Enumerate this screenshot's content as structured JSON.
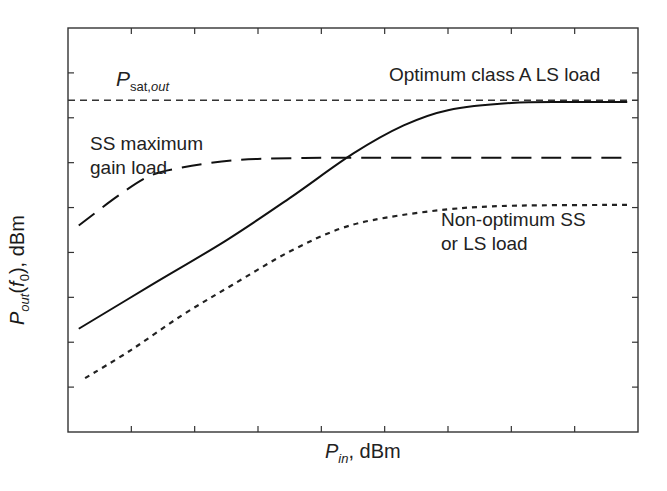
{
  "chart_data": {
    "type": "line",
    "title": "",
    "xlabel": "P_in, dBm",
    "ylabel": "P_out(f_0), dBm",
    "xlabel_parts": {
      "main": "P",
      "sub": "in",
      "unit": ", dBm"
    },
    "ylabel_parts": {
      "main": "P",
      "sub": "out",
      "arg_pre": "(",
      "arg": "f",
      "arg_sub": "0",
      "arg_post": ")",
      "unit": ", dBm"
    },
    "x_ticks": 8,
    "y_ticks": 8,
    "tick_labels": "none (qualitative axes)",
    "grid": false,
    "xlim": [
      0,
      9
    ],
    "ylim": [
      0,
      9
    ],
    "reference_line": {
      "name": "P_sat,out",
      "style": "short-dash",
      "y": 7.39
    },
    "series": [
      {
        "name": "Optimum class A LS load",
        "style": "solid",
        "x": [
          0.17,
          1.3,
          2.5,
          3.5,
          4.5,
          5.3,
          6.0,
          7.0,
          8.0,
          8.83
        ],
        "y": [
          2.3,
          3.26,
          4.27,
          5.21,
          6.2,
          6.83,
          7.17,
          7.33,
          7.35,
          7.35
        ]
      },
      {
        "name": "SS maximum gain load",
        "style": "long-dash",
        "x": [
          0.17,
          0.8,
          1.3,
          1.8,
          2.6,
          3.5,
          4.5,
          6.0,
          7.5,
          8.83
        ],
        "y": [
          4.6,
          5.27,
          5.71,
          5.89,
          6.05,
          6.1,
          6.11,
          6.11,
          6.11,
          6.11
        ]
      },
      {
        "name": "Non-optimum SS or LS load",
        "style": "dotted",
        "x": [
          0.27,
          1.0,
          1.8,
          2.6,
          3.5,
          4.3,
          5.0,
          6.0,
          7.0,
          8.83
        ],
        "y": [
          1.2,
          1.83,
          2.6,
          3.28,
          4.02,
          4.53,
          4.77,
          4.96,
          5.04,
          5.06
        ]
      }
    ],
    "annotations": [
      {
        "text": "P_sat,out",
        "near": "reference_line_left"
      },
      {
        "text": "Optimum class A LS load",
        "near": "solid_curve_top_right"
      },
      {
        "text": "SS maximum gain load",
        "near": "long_dash_curve_left"
      },
      {
        "text": "Non-optimum SS or LS load",
        "near": "dotted_curve_right"
      }
    ]
  },
  "labels": {
    "psat_main": "P",
    "psat_sub": "sat,",
    "psat_sub_it": "out",
    "optimum": "Optimum class A LS load",
    "ss_line1": "SS maximum",
    "ss_line2": "gain load",
    "nonopt_line1": "Non-optimum SS",
    "nonopt_line2": "or LS load",
    "x_main": "P",
    "x_sub": "in",
    "x_unit": ", dBm",
    "y_main": "P",
    "y_sub": "out",
    "y_open": "(",
    "y_arg": "f",
    "y_arg_sub": "0",
    "y_close": ")",
    "y_unit": ", dBm"
  }
}
